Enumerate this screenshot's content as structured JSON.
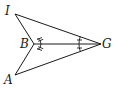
{
  "diagram": {
    "type": "geometry-figure",
    "points": [
      {
        "id": "I",
        "label": "I"
      },
      {
        "id": "B",
        "label": "B"
      },
      {
        "id": "G",
        "label": "G"
      },
      {
        "id": "A",
        "label": "A"
      }
    ],
    "segments": [
      {
        "from": "I",
        "to": "G"
      },
      {
        "from": "A",
        "to": "G"
      },
      {
        "from": "I",
        "to": "B"
      },
      {
        "from": "A",
        "to": "B"
      },
      {
        "from": "B",
        "to": "G"
      }
    ],
    "angle_marks": [
      {
        "vertex": "B",
        "between": [
          "I",
          "G"
        ],
        "ticks": 2
      },
      {
        "vertex": "B",
        "between": [
          "G",
          "A"
        ],
        "ticks": 2
      },
      {
        "vertex": "G",
        "between": [
          "I",
          "B"
        ],
        "ticks": 1
      },
      {
        "vertex": "G",
        "between": [
          "B",
          "A"
        ],
        "ticks": 1
      }
    ],
    "congruences": [
      "∠IBG = ∠ABG",
      "∠IGB = ∠AGB"
    ]
  }
}
